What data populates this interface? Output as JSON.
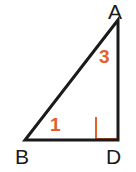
{
  "figure": {
    "type": "right-triangle-diagram",
    "background_color": "#ffffff",
    "stroke_color": "#1a1a1a",
    "stroke_width": 3,
    "accent_color": "#e2612a",
    "width": 136,
    "height": 172,
    "vertices": [
      {
        "name": "A",
        "label": "A",
        "x": 118,
        "y": 20,
        "label_position": "above-right"
      },
      {
        "name": "B",
        "label": "B",
        "x": 25,
        "y": 140,
        "label_position": "below-left"
      },
      {
        "name": "D",
        "label": "D",
        "x": 118,
        "y": 140,
        "label_position": "below-right"
      }
    ],
    "sides": [
      {
        "name": "AB",
        "from": "A",
        "to": "B",
        "role": "hypotenuse"
      },
      {
        "name": "BD",
        "from": "B",
        "to": "D",
        "role": "base"
      },
      {
        "name": "AD",
        "from": "A",
        "to": "D",
        "role": "vertical-leg"
      }
    ],
    "angle_labels": [
      {
        "label": "1",
        "at_vertex": "B",
        "color": "#e2612a"
      },
      {
        "label": "3",
        "at_vertex": "A",
        "color": "#e2612a"
      }
    ],
    "right_angle": {
      "at_vertex": "D",
      "marker": "square",
      "color": "#e2612a",
      "size": 22
    }
  }
}
